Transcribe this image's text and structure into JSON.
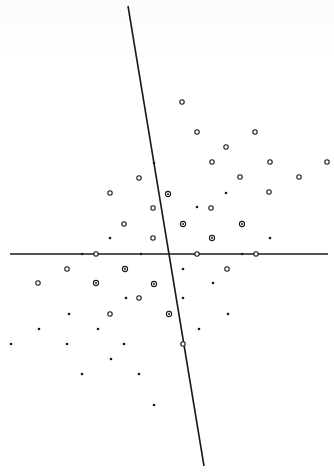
{
  "figure": {
    "width": 334,
    "height": 474,
    "colors": {
      "ink": "#1a1a1a",
      "background": "#ffffff"
    },
    "axes": [
      {
        "name": "horizontal-axis",
        "x1": 10,
        "y1": 254,
        "x2": 328,
        "y2": 254
      },
      {
        "name": "skew-axis",
        "x1": 128,
        "y1": 6,
        "x2": 204,
        "y2": 466
      }
    ],
    "legend_types": {
      "o": "open circle",
      "dot": "filled dot",
      "target": "circled dot"
    },
    "points": [
      {
        "x": 182,
        "y": 102,
        "t": "o"
      },
      {
        "x": 197,
        "y": 132,
        "t": "o"
      },
      {
        "x": 255,
        "y": 132,
        "t": "o"
      },
      {
        "x": 226,
        "y": 147,
        "t": "o"
      },
      {
        "x": 154,
        "y": 163,
        "t": "dot"
      },
      {
        "x": 212,
        "y": 162,
        "t": "o"
      },
      {
        "x": 270,
        "y": 162,
        "t": "o"
      },
      {
        "x": 327,
        "y": 162,
        "t": "o"
      },
      {
        "x": 139,
        "y": 178,
        "t": "o"
      },
      {
        "x": 240,
        "y": 177,
        "t": "o"
      },
      {
        "x": 299,
        "y": 177,
        "t": "o"
      },
      {
        "x": 110,
        "y": 193,
        "t": "o"
      },
      {
        "x": 168,
        "y": 194,
        "t": "target"
      },
      {
        "x": 226,
        "y": 193,
        "t": "dot"
      },
      {
        "x": 269,
        "y": 192,
        "t": "o"
      },
      {
        "x": 153,
        "y": 208,
        "t": "o"
      },
      {
        "x": 197,
        "y": 207,
        "t": "dot"
      },
      {
        "x": 211,
        "y": 208,
        "t": "o"
      },
      {
        "x": 124,
        "y": 224,
        "t": "o"
      },
      {
        "x": 183,
        "y": 224,
        "t": "target"
      },
      {
        "x": 242,
        "y": 224,
        "t": "target"
      },
      {
        "x": 110,
        "y": 238,
        "t": "dot"
      },
      {
        "x": 153,
        "y": 238,
        "t": "o"
      },
      {
        "x": 212,
        "y": 238,
        "t": "target"
      },
      {
        "x": 270,
        "y": 238,
        "t": "dot"
      },
      {
        "x": 82,
        "y": 254,
        "t": "dot"
      },
      {
        "x": 96,
        "y": 254,
        "t": "o"
      },
      {
        "x": 141,
        "y": 254,
        "t": "dot"
      },
      {
        "x": 197,
        "y": 254,
        "t": "o"
      },
      {
        "x": 242,
        "y": 254,
        "t": "dot"
      },
      {
        "x": 256,
        "y": 254,
        "t": "o"
      },
      {
        "x": 67,
        "y": 269,
        "t": "o"
      },
      {
        "x": 125,
        "y": 269,
        "t": "target"
      },
      {
        "x": 183,
        "y": 269,
        "t": "dot"
      },
      {
        "x": 227,
        "y": 269,
        "t": "o"
      },
      {
        "x": 38,
        "y": 283,
        "t": "o"
      },
      {
        "x": 96,
        "y": 283,
        "t": "target"
      },
      {
        "x": 154,
        "y": 284,
        "t": "target"
      },
      {
        "x": 213,
        "y": 283,
        "t": "dot"
      },
      {
        "x": 126,
        "y": 298,
        "t": "dot"
      },
      {
        "x": 139,
        "y": 298,
        "t": "o"
      },
      {
        "x": 183,
        "y": 298,
        "t": "dot"
      },
      {
        "x": 69,
        "y": 314,
        "t": "dot"
      },
      {
        "x": 110,
        "y": 314,
        "t": "o"
      },
      {
        "x": 169,
        "y": 314,
        "t": "target"
      },
      {
        "x": 228,
        "y": 314,
        "t": "dot"
      },
      {
        "x": 39,
        "y": 329,
        "t": "dot"
      },
      {
        "x": 98,
        "y": 329,
        "t": "dot"
      },
      {
        "x": 199,
        "y": 329,
        "t": "dot"
      },
      {
        "x": 11,
        "y": 344,
        "t": "dot"
      },
      {
        "x": 67,
        "y": 344,
        "t": "dot"
      },
      {
        "x": 124,
        "y": 344,
        "t": "dot"
      },
      {
        "x": 183,
        "y": 344,
        "t": "o"
      },
      {
        "x": 111,
        "y": 359,
        "t": "dot"
      },
      {
        "x": 82,
        "y": 374,
        "t": "dot"
      },
      {
        "x": 139,
        "y": 374,
        "t": "dot"
      },
      {
        "x": 154,
        "y": 405,
        "t": "dot"
      }
    ]
  }
}
